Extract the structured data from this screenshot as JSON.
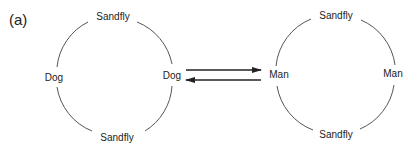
{
  "panel_label": "(a)",
  "left_cycle": {
    "top": "Sandfly",
    "bottom": "Sandfly",
    "left": "Dog",
    "right": "Dog"
  },
  "right_cycle": {
    "top": "Sandfly",
    "bottom": "Sandfly",
    "left": "Man",
    "right": "Man"
  },
  "arrows": [
    {
      "from": "Dog",
      "to": "Man",
      "direction": "right"
    },
    {
      "from": "Man",
      "to": "Dog",
      "direction": "left"
    }
  ],
  "colors": {
    "line": "#222222",
    "text": "#222222",
    "background": "#ffffff"
  }
}
